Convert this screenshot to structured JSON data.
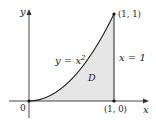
{
  "diagram": {
    "axes": {
      "x_label": "x",
      "y_label": "y",
      "origin_label": "0"
    },
    "points": [
      {
        "label": "(1, 1)",
        "x": 1,
        "y": 1
      },
      {
        "label": "(1, 0)",
        "x": 1,
        "y": 0
      },
      {
        "label": "0",
        "x": 0,
        "y": 0
      }
    ],
    "curve": {
      "equation_lhs": "y = x",
      "equation_exp": "2"
    },
    "line": {
      "equation": "x = 1"
    },
    "region": {
      "label": "D",
      "fill": "#e6e6e6"
    },
    "colors": {
      "stroke": "#222222",
      "region_fill": "#e6e6e6"
    }
  }
}
